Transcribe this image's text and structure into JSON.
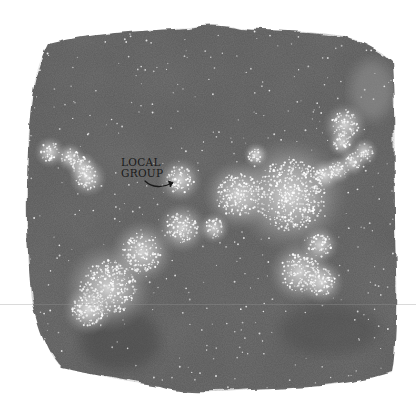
{
  "illustration": {
    "title": "Watercolor map of galaxy clusters",
    "label": {
      "line1": "LOCAL",
      "line2": "GROUP",
      "arrow": "curved-arrow-right",
      "x": 121,
      "y": 156
    },
    "colors": {
      "background": "#ffffff",
      "wash_dark": "#5a5a5a",
      "wash_mid": "#6e6e6e",
      "cluster_glow": "#e8e8e8",
      "star": "#f4f4f4",
      "label_ink": "#1a1a1a"
    },
    "clusters": [
      {
        "name": "local-group",
        "cx": 180,
        "cy": 180,
        "r": 14
      },
      {
        "name": "left-chain-1",
        "cx": 50,
        "cy": 152,
        "r": 10
      },
      {
        "name": "left-chain-2",
        "cx": 70,
        "cy": 157,
        "r": 9
      },
      {
        "name": "left-chain-3",
        "cx": 82,
        "cy": 167,
        "r": 10
      },
      {
        "name": "left-chain-4",
        "cx": 88,
        "cy": 178,
        "r": 12
      },
      {
        "name": "central-supercluster",
        "cx": 290,
        "cy": 195,
        "r": 36
      },
      {
        "name": "central-west",
        "cx": 238,
        "cy": 195,
        "r": 22
      },
      {
        "name": "filament-diagonal",
        "cx": 182,
        "cy": 228,
        "r": 16
      },
      {
        "name": "mid-blob",
        "cx": 142,
        "cy": 252,
        "r": 20
      },
      {
        "name": "lower-left-blob",
        "cx": 108,
        "cy": 288,
        "r": 28
      },
      {
        "name": "bottom-left",
        "cx": 88,
        "cy": 310,
        "r": 16
      },
      {
        "name": "upper-right-1",
        "cx": 345,
        "cy": 125,
        "r": 14
      },
      {
        "name": "upper-right-2",
        "cx": 342,
        "cy": 143,
        "r": 9
      },
      {
        "name": "upper-right-3",
        "cx": 364,
        "cy": 152,
        "r": 9
      },
      {
        "name": "upper-right-4",
        "cx": 352,
        "cy": 162,
        "r": 9
      },
      {
        "name": "right-mid-1",
        "cx": 325,
        "cy": 175,
        "r": 10
      },
      {
        "name": "right-mid-2",
        "cx": 338,
        "cy": 170,
        "r": 9
      },
      {
        "name": "right-lower-1",
        "cx": 320,
        "cy": 245,
        "r": 12
      },
      {
        "name": "right-lower-2",
        "cx": 300,
        "cy": 272,
        "r": 20
      },
      {
        "name": "right-lower-3",
        "cx": 322,
        "cy": 282,
        "r": 14
      },
      {
        "name": "lower-mid",
        "cx": 214,
        "cy": 228,
        "r": 10
      },
      {
        "name": "top-center-small",
        "cx": 256,
        "cy": 155,
        "r": 8
      }
    ]
  }
}
